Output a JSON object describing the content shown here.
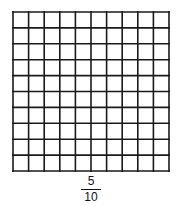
{
  "grid": {
    "rows": 10,
    "cols": 10,
    "shaded_cells": 0,
    "line_color": "#1a1a1a",
    "fill_color": "#ffffff"
  },
  "fraction": {
    "numerator": "5",
    "denominator": "10"
  }
}
